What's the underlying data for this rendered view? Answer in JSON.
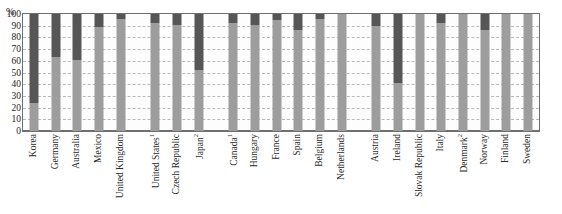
{
  "title_cut": "",
  "axis": {
    "y_unit": "%",
    "yticks": [
      100,
      90,
      80,
      70,
      60,
      50,
      40,
      30,
      20,
      10,
      0
    ]
  },
  "chart_data": {
    "type": "bar",
    "title": "",
    "subtitle": "",
    "xlabel": "",
    "ylabel": "%",
    "ylim": [
      0,
      100
    ],
    "grid": true,
    "legend": "none",
    "stacked": true,
    "colors": {
      "lower_segment": "#9d9d9d",
      "upper_segment": "#565656",
      "plot_border": "#6f6f6f",
      "gridline": "#b9b9b9"
    },
    "categories": [
      "Korea",
      "Germany",
      "Australia",
      "Mexico",
      "United Kingdom",
      "United States¹",
      "Czech Republic",
      "Japan²",
      "Canada¹",
      "Hungary",
      "France",
      "Spain",
      "Belgium",
      "Netherlands",
      "Austria",
      "Ireland",
      "Slovak Republic",
      "Italy",
      "Denmark²",
      "Norway",
      "Finland",
      "Sweden"
    ],
    "groups": [
      {
        "size": 5
      },
      {
        "size": 3
      },
      {
        "size": 6
      },
      {
        "size": 8
      }
    ],
    "series": [
      {
        "name": "lower segment",
        "values": [
          24,
          63,
          61,
          89,
          96,
          92,
          91,
          52,
          92,
          91,
          95,
          86,
          96,
          100,
          90,
          41,
          100,
          92,
          100,
          86,
          100,
          100
        ]
      },
      {
        "name": "upper segment",
        "values": [
          76,
          37,
          39,
          11,
          4,
          8,
          9,
          48,
          8,
          9,
          5,
          14,
          4,
          0,
          10,
          59,
          0,
          8,
          0,
          14,
          0,
          0
        ]
      }
    ]
  }
}
